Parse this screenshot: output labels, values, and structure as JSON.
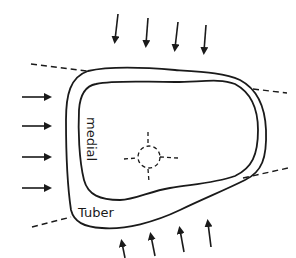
{
  "diagram": {
    "colors": {
      "background": "#ffffff",
      "line": "#1a1a1a"
    },
    "labels": {
      "medial": "medial",
      "tuber": "Tuber"
    },
    "arrows": {
      "top": {
        "count": 4,
        "direction": "down"
      },
      "left": {
        "count": 4,
        "direction": "right"
      },
      "bottom": {
        "count": 4,
        "direction": "up"
      }
    },
    "dashed_lines": [
      {
        "name": "upper-left"
      },
      {
        "name": "upper-right"
      },
      {
        "name": "lower-left"
      },
      {
        "name": "lower-right"
      }
    ],
    "outlines": [
      {
        "name": "outer-contour"
      },
      {
        "name": "inner-contour"
      }
    ],
    "center_marker": {
      "name": "dashed-circle-crosshair"
    }
  }
}
